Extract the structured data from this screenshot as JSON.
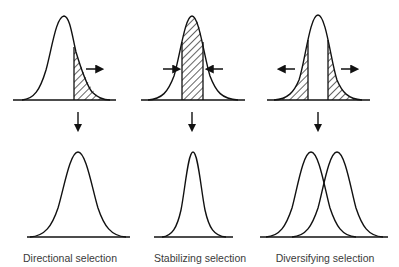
{
  "figure": {
    "type": "natural-selection-modes",
    "panels": [
      {
        "id": "directional",
        "label": "Directional selection",
        "before": {
          "shape": "normal-curve",
          "hatched_region": "right tail",
          "arrows": [
            "right"
          ]
        },
        "after": {
          "shape": "normal-curve shifted right",
          "curves": 1
        }
      },
      {
        "id": "stabilizing",
        "label": "Stabilizing selection",
        "before": {
          "shape": "normal-curve",
          "hatched_region": "center band",
          "arrows": [
            "inward-left",
            "inward-right"
          ]
        },
        "after": {
          "shape": "narrower normal-curve",
          "curves": 1
        }
      },
      {
        "id": "diversifying",
        "label": "Diversifying selection",
        "before": {
          "shape": "normal-curve",
          "hatched_region": "both tails",
          "arrows": [
            "left",
            "right"
          ]
        },
        "after": {
          "shape": "two overlapping normal-curves",
          "curves": 2
        }
      }
    ],
    "colors": {
      "line": "#111111",
      "background": "#ffffff",
      "label_text": "#3a3a3a"
    }
  }
}
